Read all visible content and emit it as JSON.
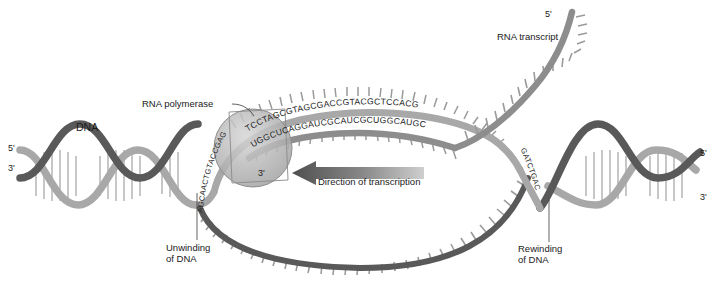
{
  "figure": {
    "labels": {
      "dna": "DNA",
      "rna_polymerase": "RNA polymerase",
      "rna_transcript": "RNA transcript",
      "unwinding": "Unwinding\nof DNA",
      "rewinding": "Rewinding\nof DNA",
      "direction": "Direction of transcription"
    },
    "prime_ends": {
      "left_top": "5'",
      "left_bottom": "3'",
      "right_top": "5'",
      "right_bottom": "3'",
      "rna_five_prime": "5'",
      "rna_three_prime": "3'"
    },
    "sequences": {
      "coding_strand_left": "AGCAACTGTACCGAG",
      "coding_strand_bubble": "TCCTAGCGTAGCGACCGTACGCTCCACG",
      "coding_strand_right": "GATCTGAC",
      "rna_strand": "UGGCUCAGGAUCGCAUCGCUGGCAUGC"
    },
    "colors": {
      "dark_strand": "#595959",
      "light_strand": "#a8a8a8",
      "rna": "#8d8d8d",
      "polymerase_fill": "#b9b9b9",
      "arrow": "#585858",
      "text": "#1a1a1a",
      "background": "#ffffff"
    }
  }
}
